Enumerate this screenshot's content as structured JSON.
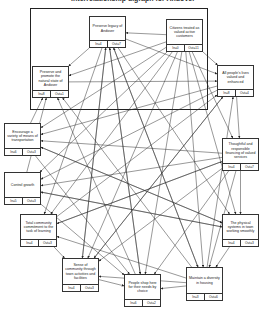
{
  "title": "Interrelationship digraph for Andover",
  "frame": {
    "x": 30,
    "y": 8,
    "w": 178,
    "h": 102
  },
  "nodes": [
    {
      "id": "legacy",
      "label": "Preserve legacy of Andover",
      "in": "In=4",
      "out": "Out=7",
      "x": 89,
      "y": 16,
      "w": 37,
      "h": 32
    },
    {
      "id": "citizens",
      "label": "Citizens treated as valued active customers",
      "in": "In=0",
      "out": "Out=11",
      "x": 166,
      "y": 19,
      "w": 37,
      "h": 33
    },
    {
      "id": "natural",
      "label": "Preserve and promote the natural state of Andover",
      "in": "In=8",
      "out": "Out=1",
      "x": 32,
      "y": 66,
      "w": 37,
      "h": 32
    },
    {
      "id": "lives",
      "label": "All people's lives valued and enhanced",
      "in": "In=8",
      "out": "Out=4",
      "x": 217,
      "y": 65,
      "w": 37,
      "h": 32
    },
    {
      "id": "transport",
      "label": "Encourage a variety of means of transportation",
      "in": "In=6",
      "out": "Out=3",
      "x": 4,
      "y": 123,
      "w": 37,
      "h": 33
    },
    {
      "id": "services",
      "label": "Thoughtful and responsible financing of valued services",
      "in": "In=4",
      "out": "Out=7",
      "x": 222,
      "y": 138,
      "w": 37,
      "h": 33
    },
    {
      "id": "growth",
      "label": "Control growth",
      "in": "In=5",
      "out": "Out=3",
      "x": 4,
      "y": 172,
      "w": 37,
      "h": 33
    },
    {
      "id": "learning",
      "label": "Total community commitment to the task of learning",
      "in": "In=4",
      "out": "Out=3",
      "x": 20,
      "y": 214,
      "w": 37,
      "h": 33
    },
    {
      "id": "physical",
      "label": "The physical systems in town working smoothly",
      "in": "In=4",
      "out": "Out=3",
      "x": 222,
      "y": 214,
      "w": 37,
      "h": 33
    },
    {
      "id": "community",
      "label": "Sense of community through town activities and facilities",
      "in": "In=4",
      "out": "Out=3",
      "x": 62,
      "y": 258,
      "w": 37,
      "h": 34
    },
    {
      "id": "shop",
      "label": "People shop here for their needs by choice",
      "in": "In=6",
      "out": "Out=2",
      "x": 124,
      "y": 274,
      "w": 37,
      "h": 33
    },
    {
      "id": "housing",
      "label": "Maintain a diversity in housing",
      "in": "In=3",
      "out": "Out=6",
      "x": 186,
      "y": 267,
      "w": 37,
      "h": 34
    }
  ],
  "edges": [
    [
      "citizens",
      "legacy"
    ],
    [
      "citizens",
      "natural"
    ],
    [
      "citizens",
      "lives"
    ],
    [
      "citizens",
      "transport"
    ],
    [
      "citizens",
      "growth"
    ],
    [
      "citizens",
      "learning"
    ],
    [
      "citizens",
      "community"
    ],
    [
      "citizens",
      "shop"
    ],
    [
      "citizens",
      "housing"
    ],
    [
      "citizens",
      "physical"
    ],
    [
      "citizens",
      "services"
    ],
    [
      "legacy",
      "natural"
    ],
    [
      "legacy",
      "lives"
    ],
    [
      "legacy",
      "community"
    ],
    [
      "legacy",
      "shop"
    ],
    [
      "legacy",
      "learning"
    ],
    [
      "legacy",
      "physical"
    ],
    [
      "legacy",
      "housing"
    ],
    [
      "natural",
      "lives"
    ],
    [
      "lives",
      "services"
    ],
    [
      "lives",
      "transport"
    ],
    [
      "lives",
      "growth"
    ],
    [
      "lives",
      "community"
    ],
    [
      "transport",
      "natural"
    ],
    [
      "transport",
      "physical"
    ],
    [
      "transport",
      "shop"
    ],
    [
      "services",
      "physical"
    ],
    [
      "services",
      "transport"
    ],
    [
      "services",
      "growth"
    ],
    [
      "services",
      "learning"
    ],
    [
      "services",
      "community"
    ],
    [
      "services",
      "shop"
    ],
    [
      "services",
      "housing"
    ],
    [
      "growth",
      "natural"
    ],
    [
      "growth",
      "physical"
    ],
    [
      "growth",
      "shop"
    ],
    [
      "learning",
      "community"
    ],
    [
      "learning",
      "lives"
    ],
    [
      "learning",
      "services"
    ],
    [
      "physical",
      "housing"
    ],
    [
      "physical",
      "transport"
    ],
    [
      "physical",
      "growth"
    ],
    [
      "community",
      "shop"
    ],
    [
      "community",
      "legacy"
    ],
    [
      "community",
      "lives"
    ],
    [
      "shop",
      "legacy"
    ],
    [
      "shop",
      "natural"
    ],
    [
      "housing",
      "learning"
    ],
    [
      "housing",
      "natural"
    ],
    [
      "housing",
      "legacy"
    ],
    [
      "housing",
      "lives"
    ],
    [
      "housing",
      "shop"
    ],
    [
      "housing",
      "community"
    ]
  ]
}
